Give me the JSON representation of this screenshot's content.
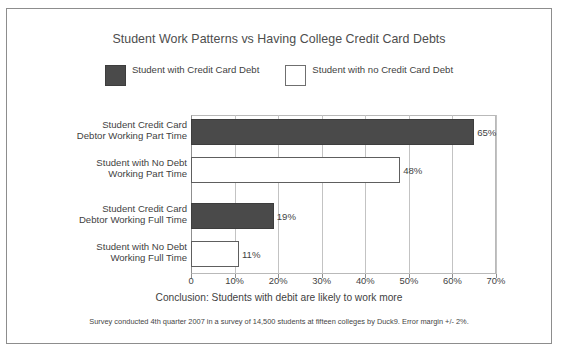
{
  "chart_data": {
    "type": "bar",
    "orientation": "horizontal",
    "title": "Student Work Patterns vs Having College Credit Card Debts",
    "xlabel": "",
    "ylabel": "",
    "xlim": [
      0,
      70
    ],
    "grid": true,
    "legend_position": "top-center",
    "legend": [
      {
        "label": "Student with\nCredit Card Debt",
        "style": "filled",
        "color": "#4a4a4a"
      },
      {
        "label": "Student with no\nCredit Card Debt",
        "style": "hollow",
        "color": "#ffffff"
      }
    ],
    "categories": [
      "Student Credit Card\nDebtor Working Part Time",
      "Student with No Debt\nWorking Part Time",
      "Student Credit Card\nDebtor Working Full Time",
      "Student with No Debt\nWorking Full Time"
    ],
    "values": [
      65,
      48,
      19,
      11
    ],
    "value_labels": [
      "65%",
      "48%",
      "19%",
      "11%"
    ],
    "bar_styles": [
      "filled",
      "hollow",
      "filled",
      "hollow"
    ],
    "xticks": [
      0,
      10,
      20,
      30,
      40,
      50,
      60,
      70
    ],
    "xtick_labels": [
      "0",
      "10%",
      "20%",
      "30%",
      "40%",
      "50%",
      "60%",
      "70%"
    ],
    "annotations": {
      "conclusion": "Conclusion:  Students with debit are likely to work more",
      "footnote": "Survey conducted 4th quarter 2007 in a survey of 14,500 students at fifteen colleges by Duck9. Error margin +/- 2%."
    }
  },
  "colors": {
    "bar_filled": "#4a4a4a",
    "bar_hollow": "#ffffff",
    "bar_outline": "#5e5e5e",
    "gridline": "#c3c3c3",
    "frame_border": "#8d8d8d",
    "text": "#3f3f3f",
    "title_text": "#4d4d4d"
  }
}
